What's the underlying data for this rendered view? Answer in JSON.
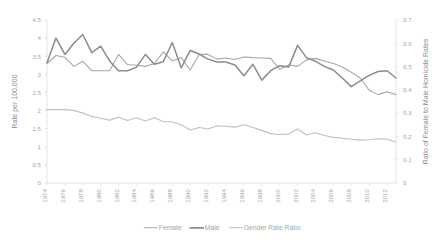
{
  "chart_data": {
    "type": "line",
    "title": "",
    "subtitle": "",
    "xlabel": "",
    "ylabel": "Rate per 100,000",
    "y2label": "Ratio of Female to Male Homicide Rates",
    "grid": false,
    "legend_position": "bottom",
    "x": [
      1974,
      1975,
      1976,
      1977,
      1978,
      1979,
      1980,
      1981,
      1982,
      1983,
      1984,
      1985,
      1986,
      1987,
      1988,
      1989,
      1990,
      1991,
      1992,
      1993,
      1994,
      1995,
      1996,
      1997,
      1998,
      1999,
      2000,
      2001,
      2002,
      2003,
      2004,
      2005,
      2006,
      2007,
      2008,
      2009,
      2010,
      2011,
      2012,
      2013
    ],
    "xticks": [
      1974,
      1976,
      1978,
      1980,
      1982,
      1984,
      1986,
      1988,
      1990,
      1992,
      1994,
      1996,
      1998,
      2000,
      2002,
      2004,
      2006,
      2008,
      2010,
      2012
    ],
    "ylim": [
      0,
      4.5
    ],
    "yticks": [
      0,
      0.5,
      1,
      1.5,
      2,
      2.5,
      3,
      3.5,
      4,
      4.5
    ],
    "ytick_labels": [
      "0",
      "0.5",
      "1",
      "1.5",
      "2",
      "2.5",
      "3",
      "3.5",
      "4",
      "4.5"
    ],
    "y2lim": [
      0,
      0.7
    ],
    "y2ticks": [
      0,
      0.1,
      0.2,
      0.3,
      0.4,
      0.5,
      0.6,
      0.7
    ],
    "y2tick_labels": [
      "0",
      "0.1",
      "0.2",
      "0.3",
      "0.4",
      "0.5",
      "0.6",
      "0.7"
    ],
    "series": [
      {
        "name": "Female",
        "axis": "left",
        "color": "#a6a6a6",
        "width": 1.1,
        "values": [
          3.3,
          3.52,
          3.47,
          3.22,
          3.36,
          3.1,
          3.1,
          3.1,
          3.55,
          3.27,
          3.25,
          3.22,
          3.3,
          3.62,
          3.37,
          3.46,
          3.12,
          3.55,
          3.55,
          3.42,
          3.45,
          3.41,
          3.48,
          3.46,
          3.45,
          3.44,
          3.14,
          3.26,
          3.22,
          3.4,
          3.44,
          3.37,
          3.3,
          3.2,
          3.06,
          2.9,
          2.56,
          2.44,
          2.52,
          2.44
        ]
      },
      {
        "name": "Male",
        "axis": "left",
        "color": "#8c8c8c",
        "width": 1.5,
        "values": [
          3.32,
          4.0,
          3.55,
          3.86,
          4.1,
          3.6,
          3.78,
          3.37,
          3.1,
          3.1,
          3.2,
          3.55,
          3.28,
          3.35,
          3.88,
          3.18,
          3.66,
          3.56,
          3.42,
          3.34,
          3.34,
          3.26,
          2.96,
          3.28,
          2.84,
          3.1,
          3.24,
          3.2,
          3.8,
          3.46,
          3.36,
          3.22,
          3.12,
          2.9,
          2.66,
          2.82,
          2.97,
          3.08,
          3.1,
          2.9
        ]
      },
      {
        "name": "Gender Rate Ratio",
        "axis": "right",
        "color": "#bfbfbf",
        "width": 1.1,
        "values": [
          0.315,
          0.315,
          0.315,
          0.312,
          0.3,
          0.286,
          0.278,
          0.27,
          0.282,
          0.268,
          0.28,
          0.266,
          0.28,
          0.264,
          0.262,
          0.25,
          0.228,
          0.238,
          0.232,
          0.246,
          0.244,
          0.24,
          0.25,
          0.238,
          0.226,
          0.212,
          0.208,
          0.21,
          0.232,
          0.206,
          0.216,
          0.204,
          0.196,
          0.192,
          0.188,
          0.184,
          0.186,
          0.19,
          0.188,
          0.176
        ]
      }
    ],
    "legend": [
      {
        "label": "Female",
        "color": "#a6a6a6",
        "width": 1.1
      },
      {
        "label": "Male",
        "color": "#8c8c8c",
        "width": 1.8
      },
      {
        "label": "Gender Rate Ratio",
        "color": "#bfbfbf",
        "width": 1.1
      }
    ]
  }
}
